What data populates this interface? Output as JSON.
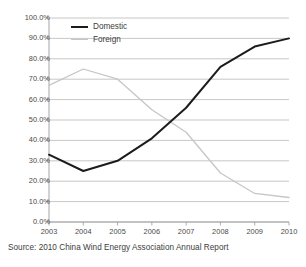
{
  "figure": {
    "source_caption": "Source: 2010 China Wind Energy Association Annual Report"
  },
  "colors": {
    "domestic_line": "#1c1c1c",
    "foreign_line": "#c6c6c6",
    "gridline": "#b9b9b9",
    "axis": "#9a9a9a",
    "text": "#3d3d3d",
    "background": "#ffffff"
  },
  "legend": {
    "position": "inside-top-left",
    "entries": [
      {
        "label": "Domestic",
        "swatch": "thick-black-line"
      },
      {
        "label": "Foreign",
        "swatch": "thin-gray-line"
      }
    ]
  },
  "chart_data": {
    "type": "line",
    "title": "",
    "subtitle": "",
    "xlabel": "",
    "ylabel": "",
    "x": [
      "2003",
      "2004",
      "2005",
      "2006",
      "2007",
      "2008",
      "2009",
      "2010"
    ],
    "categories": [
      "2003",
      "2004",
      "2005",
      "2006",
      "2007",
      "2008",
      "2009",
      "2010"
    ],
    "series": [
      {
        "name": "Domestic",
        "color": "#1c1c1c",
        "values": [
          33.0,
          25.0,
          30.0,
          41.0,
          56.0,
          76.0,
          86.0,
          90.0
        ]
      },
      {
        "name": "Foreign",
        "color": "#c6c6c6",
        "values": [
          67.0,
          75.0,
          70.0,
          55.0,
          44.0,
          24.0,
          14.0,
          12.0
        ]
      }
    ],
    "ylim": [
      0,
      100
    ],
    "ytick_values": [
      0,
      10,
      20,
      30,
      40,
      50,
      60,
      70,
      80,
      90,
      100
    ],
    "ytick_labels": [
      "0.0%",
      "10.0%",
      "20.0%",
      "30.0%",
      "40.0%",
      "50.0%",
      "60.0%",
      "70.0%",
      "80.0%",
      "90.0%",
      "100.0%"
    ],
    "xtick_labels": [
      "2003",
      "2004",
      "2005",
      "2006",
      "2007",
      "2008",
      "2009",
      "2010"
    ],
    "grid": {
      "horizontal": true,
      "vertical": false
    },
    "legend_position": "inside-top-left",
    "units": "percent",
    "annotations": []
  }
}
